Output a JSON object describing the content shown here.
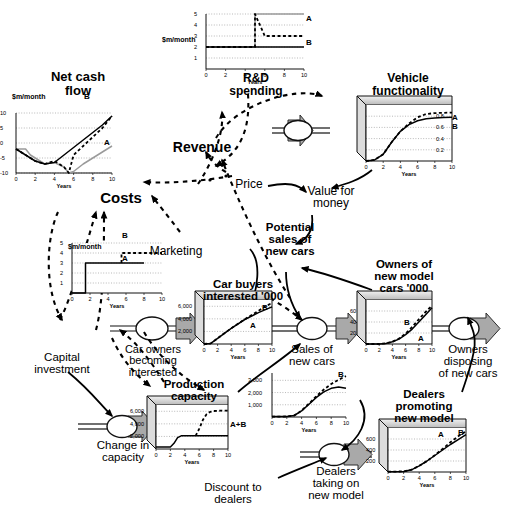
{
  "diagram": {
    "type": "stock-and-flow"
  },
  "labels": {
    "revenue": "Revenue",
    "price": "Price",
    "costs": "Costs",
    "marketing": "Marketing",
    "value_for_money": "Value for\nmoney",
    "potential_sales": "Potential\nsales of\nnew cars",
    "capital_investment": "Capital\ninvestment",
    "car_owners_becoming_interested": "Car owners\nbecoming\ninterested",
    "sales_of_new_cars": "Sales of\nnew cars",
    "owners_disposing": "Owners\ndisposing\nof new cars",
    "change_in_capacity": "Change in\ncapacity",
    "dealers_taking_on": "Dealers\ntaking on\nnew model",
    "discount_to_dealers": "Discount to\ndealers"
  },
  "charts": [
    {
      "id": "net-cash-flow",
      "title": "Net cash\nflow",
      "units": "$m/month",
      "box3d": false,
      "chart_data": {
        "type": "line",
        "title": "Net cash flow",
        "xlabel": "Years",
        "ylabel": "$m/month",
        "xlim": [
          0,
          10
        ],
        "ylim": [
          -10,
          10
        ],
        "xticks": [
          0,
          2,
          4,
          6,
          8,
          10
        ],
        "yticks": [
          -10,
          -5,
          0,
          5,
          10
        ],
        "grid": true,
        "series": [
          {
            "name": "A",
            "style": "solid-grey",
            "x": [
              0,
              1,
              1.5,
              2,
              2.5,
              3,
              4,
              5,
              5.5,
              6,
              7,
              8,
              9,
              10
            ],
            "y": [
              -2,
              -2,
              -4,
              -5,
              -6,
              -7,
              -6.5,
              -8,
              -10,
              -9.5,
              -7,
              -5,
              -3,
              -1
            ]
          },
          {
            "name": "B",
            "style": "dashed-black",
            "x": [
              0,
              1,
              2,
              3,
              4,
              5,
              5.5,
              6,
              7,
              8,
              9,
              10
            ],
            "y": [
              -2,
              -4,
              -6,
              -7,
              -6,
              -8,
              -10,
              -4,
              -1,
              2,
              5,
              9
            ]
          },
          {
            "name": "",
            "style": "solid-black",
            "x": [
              0,
              1,
              2,
              3,
              4,
              5,
              6,
              7,
              8,
              9,
              10
            ],
            "y": [
              -2,
              -4,
              -6,
              -7,
              -6.5,
              -4,
              -1.5,
              1,
              3.5,
              6,
              9
            ]
          }
        ]
      }
    },
    {
      "id": "rd-spending",
      "title": "R&D\nspending",
      "units": "$m/month",
      "box3d": false,
      "chart_data": {
        "type": "line",
        "title": "R&D spending",
        "xlabel": "Years",
        "ylabel": "$m/month",
        "xlim": [
          0,
          10
        ],
        "ylim": [
          0,
          5
        ],
        "xticks": [
          0,
          2,
          4,
          6,
          8,
          10
        ],
        "yticks": [
          1,
          2,
          3,
          4,
          5
        ],
        "grid": true,
        "series": [
          {
            "name": "A",
            "style": "solid-grey",
            "x": [
              0,
              5,
              5,
              10
            ],
            "y": [
              2,
              2,
              5,
              5
            ]
          },
          {
            "name": "B",
            "style": "dashed-black",
            "x": [
              0,
              5,
              5,
              6,
              10
            ],
            "y": [
              2,
              2,
              5,
              3,
              3
            ]
          },
          {
            "name": "",
            "style": "solid-black",
            "x": [
              0,
              10
            ],
            "y": [
              2,
              2
            ]
          }
        ]
      }
    },
    {
      "id": "vehicle-functionality",
      "title": "Vehicle\nfunctionality",
      "units": "",
      "box3d": true,
      "chart_data": {
        "type": "line",
        "title": "Vehicle functionality",
        "xlabel": "Years",
        "ylabel": "",
        "xlim": [
          0,
          10
        ],
        "ylim": [
          0,
          1.0
        ],
        "xticks": [
          0,
          2,
          4,
          6,
          8,
          10
        ],
        "yticks": [
          0.2,
          0.4,
          0.6,
          0.8
        ],
        "grid": true,
        "series": [
          {
            "name": "A",
            "style": "solid-black",
            "x": [
              0,
              1,
              2,
              3,
              4,
              5,
              6,
              7,
              8,
              9,
              10
            ],
            "y": [
              0.0,
              0.02,
              0.12,
              0.34,
              0.53,
              0.65,
              0.72,
              0.755,
              0.77,
              0.775,
              0.78
            ]
          },
          {
            "name": "B",
            "style": "dashed-black",
            "x": [
              0,
              1,
              2,
              3,
              4,
              5,
              6,
              7,
              8,
              9,
              10
            ],
            "y": [
              0.0,
              0.02,
              0.12,
              0.34,
              0.53,
              0.67,
              0.78,
              0.84,
              0.855,
              0.86,
              0.865
            ]
          }
        ]
      }
    },
    {
      "id": "marketing",
      "title": "Marketing",
      "units": "$m/month",
      "box3d": false,
      "chart_data": {
        "type": "line",
        "title": "Marketing",
        "xlabel": "Years",
        "ylabel": "$m/month",
        "xlim": [
          0,
          10
        ],
        "ylim": [
          0,
          5
        ],
        "xticks": [
          0,
          2,
          4,
          6,
          8,
          10
        ],
        "yticks": [
          1,
          2,
          3,
          4,
          5
        ],
        "grid": true,
        "series": [
          {
            "name": "A",
            "style": "solid-black",
            "x": [
              0,
              1.5,
              1.5,
              8
            ],
            "y": [
              0,
              0,
              3,
              3
            ]
          },
          {
            "name": "B",
            "style": "dashed-black",
            "x": [
              5.5,
              5.5,
              10
            ],
            "y": [
              3,
              4,
              4
            ]
          }
        ]
      }
    },
    {
      "id": "car-buyers-interested",
      "title": "Car buyers\ninterested '000",
      "units": "'000",
      "box3d": true,
      "chart_data": {
        "type": "line",
        "title": "Car buyers interested '000",
        "xlabel": "Years",
        "ylabel": "'000",
        "xlim": [
          0,
          10
        ],
        "ylim": [
          0,
          7000
        ],
        "xticks": [
          0,
          2,
          4,
          6,
          8,
          10
        ],
        "yticks": [
          2000,
          4000,
          6000
        ],
        "grid": true,
        "series": [
          {
            "name": "A",
            "style": "solid-black",
            "x": [
              0,
              1,
              2,
              4,
              6,
              8,
              10
            ],
            "y": [
              0,
              100,
              900,
              2500,
              3900,
              5000,
              5900
            ]
          },
          {
            "name": "B",
            "style": "dashed-black",
            "x": [
              0,
              1,
              2,
              4,
              6,
              8,
              9,
              10
            ],
            "y": [
              0,
              100,
              900,
              2500,
              3950,
              5250,
              6000,
              6500
            ]
          }
        ]
      }
    },
    {
      "id": "owners-of-new-model-cars",
      "title": "Owners of\nnew model\ncars  '000",
      "units": "'000",
      "box3d": true,
      "chart_data": {
        "type": "line",
        "title": "Owners of new model cars '000",
        "xlabel": "Years",
        "ylabel": "'000",
        "xlim": [
          0,
          10
        ],
        "ylim": [
          0,
          80
        ],
        "xticks": [
          0,
          2,
          4,
          6,
          8,
          10
        ],
        "yticks": [
          20,
          40,
          60
        ],
        "grid": true,
        "series": [
          {
            "name": "A",
            "style": "solid-black",
            "x": [
              0,
              2,
              3,
              4,
              5,
              6,
              7,
              8,
              9,
              10
            ],
            "y": [
              0,
              0,
              1,
              4,
              9,
              17,
              27,
              40,
              53,
              66
            ]
          },
          {
            "name": "B",
            "style": "dashed-black",
            "x": [
              0,
              2,
              3,
              4,
              5,
              6,
              7,
              8,
              9,
              10
            ],
            "y": [
              0,
              0,
              1,
              4,
              10,
              19,
              31,
              45,
              58,
              70
            ]
          }
        ]
      }
    },
    {
      "id": "production-capacity",
      "title": "Production\ncapacity",
      "units": "",
      "series_label": "A+B",
      "box3d": true,
      "chart_data": {
        "type": "line",
        "title": "Production capacity",
        "xlabel": "Years",
        "ylabel": "",
        "xlim": [
          0,
          10
        ],
        "ylim": [
          0,
          7000
        ],
        "xticks": [
          0,
          2,
          4,
          6,
          8,
          10
        ],
        "yticks": [
          2000,
          4000,
          6000
        ],
        "grid": true,
        "series": [
          {
            "name": "A+B",
            "style": "solid-black",
            "x": [
              0,
              2,
              2.5,
              3,
              3.5,
              10
            ],
            "y": [
              300,
              300,
              900,
              1800,
              2100,
              2100
            ]
          },
          {
            "name": "A+B dashed",
            "style": "dashed-black",
            "x": [
              5.5,
              6,
              6.5,
              7,
              7.5,
              8,
              9,
              10
            ],
            "y": [
              2100,
              3200,
              4600,
              5500,
              5900,
              6050,
              6100,
              6100
            ]
          }
        ]
      }
    },
    {
      "id": "sales-of-new-cars",
      "title": "",
      "units": "",
      "box3d": false,
      "chart_data": {
        "type": "line",
        "title": "Sales of new cars",
        "xlabel": "Years",
        "ylabel": "",
        "xlim": [
          0,
          10
        ],
        "ylim": [
          0,
          3600
        ],
        "xticks": [
          0,
          2,
          4,
          6,
          8,
          10
        ],
        "yticks": [
          1000,
          2000,
          3000
        ],
        "grid": true,
        "series": [
          {
            "name": "A",
            "style": "solid-black",
            "x": [
              0,
              2,
              3,
              4,
              5,
              6,
              7,
              8,
              9,
              10
            ],
            "y": [
              30,
              40,
              120,
              500,
              1050,
              1600,
              2050,
              2350,
              2450,
              2350
            ]
          },
          {
            "name": "B",
            "style": "dashed-black",
            "x": [
              0,
              2,
              3,
              4,
              5,
              6,
              7,
              8,
              9,
              10
            ],
            "y": [
              30,
              40,
              120,
              520,
              1100,
              1700,
              2250,
              2700,
              3050,
              3350
            ]
          }
        ]
      }
    },
    {
      "id": "dealers-promoting-new-model",
      "title": "Dealers\npromoting\nnew model",
      "units": "",
      "box3d": true,
      "chart_data": {
        "type": "line",
        "title": "Dealers promoting new model",
        "xlabel": "Years",
        "ylabel": "",
        "xlim": [
          0,
          10
        ],
        "ylim": [
          0,
          800
        ],
        "xticks": [
          0,
          2,
          4,
          6,
          8,
          10
        ],
        "yticks": [
          200,
          400,
          600
        ],
        "grid": true,
        "series": [
          {
            "name": "A",
            "style": "solid-black",
            "x": [
              0,
              2,
              3,
              4,
              5,
              6,
              7,
              8,
              9,
              10
            ],
            "y": [
              5,
              10,
              40,
              110,
              200,
              300,
              400,
              500,
              590,
              680
            ]
          },
          {
            "name": "B",
            "style": "dashed-black",
            "x": [
              0,
              2,
              3,
              4,
              5,
              6,
              7,
              8,
              9,
              10
            ],
            "y": [
              5,
              10,
              40,
              110,
              200,
              305,
              420,
              540,
              650,
              740
            ]
          }
        ]
      }
    }
  ],
  "colors": {
    "ink": "#000000",
    "grey_series": "#9a9a9a",
    "box_fill": "#ffffff",
    "box_top": "#c8c8c8",
    "box_side": "#d8d8d8",
    "flow_arrow": "#a8a8a8"
  }
}
